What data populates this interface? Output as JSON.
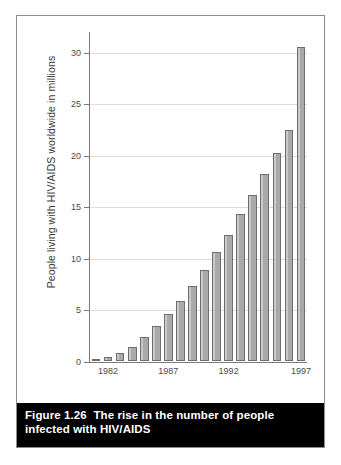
{
  "figure": {
    "caption_label": "Figure 1.26",
    "caption_body": "The rise in the number of people infected with HIV/AIDS",
    "border_color": "#8c8c8c",
    "caption_background": "#000000",
    "caption_text_color": "#ffffff"
  },
  "chart_data": {
    "type": "bar",
    "title": "",
    "xlabel": "",
    "ylabel": "People living with HIV/AIDS worldwide in millions",
    "ylim": [
      0,
      32
    ],
    "yticks": [
      0,
      5,
      10,
      15,
      20,
      25,
      30
    ],
    "ytick_labels": [
      "0",
      "5",
      "10",
      "15",
      "20",
      "25",
      "30"
    ],
    "grid": true,
    "legend": "none",
    "bar_color": "#a9a9a9",
    "bar_edge_color": "#6e6e6e",
    "categories": [
      "1981",
      "1982",
      "1983",
      "1984",
      "1985",
      "1986",
      "1987",
      "1988",
      "1989",
      "1990",
      "1991",
      "1992",
      "1993",
      "1994",
      "1995",
      "1996",
      "1997"
    ],
    "values": [
      0.2,
      0.4,
      0.8,
      1.4,
      2.3,
      3.4,
      4.6,
      5.8,
      7.3,
      8.9,
      10.6,
      12.3,
      14.3,
      16.1,
      18.2,
      20.2,
      22.5
    ],
    "extra_bar": {
      "category": "1997",
      "value": 30.5,
      "note": "final tall bar at right edge"
    },
    "xtick_labels": [
      "1982",
      "1987",
      "1992",
      "1997"
    ],
    "xtick_categories": [
      "1982",
      "1987",
      "1992",
      "1997"
    ]
  }
}
